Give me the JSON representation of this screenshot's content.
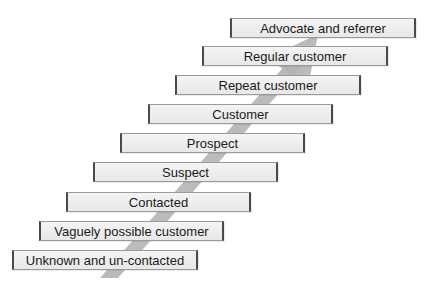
{
  "diagram": {
    "type": "staircase",
    "direction": "bottom-left to top-right",
    "arrow_color": "#b4b4b4",
    "box_fill": "#eeeeee",
    "box_border": "#4a4a4a",
    "steps": [
      {
        "label": "Unknown and un-contacted",
        "level": 1
      },
      {
        "label": "Vaguely possible customer",
        "level": 2
      },
      {
        "label": "Contacted",
        "level": 3
      },
      {
        "label": "Suspect",
        "level": 4
      },
      {
        "label": "Prospect",
        "level": 5
      },
      {
        "label": "Customer",
        "level": 6
      },
      {
        "label": "Repeat customer",
        "level": 7
      },
      {
        "label": "Regular customer",
        "level": 8
      },
      {
        "label": "Advocate and referrer",
        "level": 9
      }
    ]
  }
}
